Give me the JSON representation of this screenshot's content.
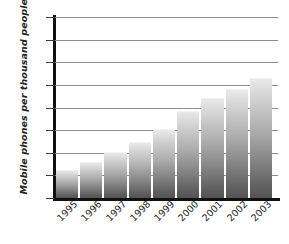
{
  "chart_data": {
    "type": "bar",
    "title": "",
    "subtitle": "",
    "xlabel": "",
    "ylabel": "Mobile phones per thousand people",
    "categories": [
      "1995",
      "1996",
      "1997",
      "1998",
      "1999",
      "2000",
      "2001",
      "2002",
      "2003"
    ],
    "values": [
      120,
      155,
      200,
      243,
      300,
      380,
      437,
      478,
      527
    ],
    "series": [
      {
        "name": "Mobile phones per thousand people",
        "values": [
          120,
          155,
          200,
          243,
          300,
          380,
          437,
          478,
          527
        ]
      }
    ],
    "ylim": [
      0,
      800
    ],
    "y_ticks": [
      0,
      100,
      200,
      300,
      400,
      500,
      600,
      700,
      800
    ],
    "y_tick_labels": [
      "0",
      "100",
      "200",
      "300",
      "400",
      "500",
      "600",
      "700",
      "800"
    ],
    "grid": true,
    "grid_axis": "y",
    "legend": false,
    "legend_position": "none",
    "bar_color_top": "#e9e9e9",
    "bar_color_bottom": "#545454",
    "axis_color": "#111111",
    "gridline_color": "#8d8d8d",
    "x_tick_label_rotation": -45,
    "annotations": []
  }
}
